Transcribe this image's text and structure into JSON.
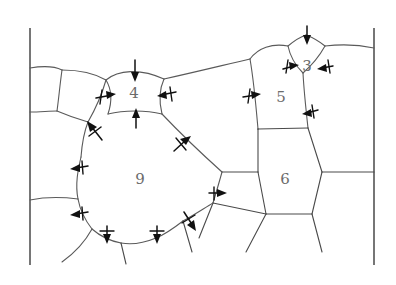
{
  "figure": {
    "width": 396,
    "height": 285,
    "background_color": "#ffffff",
    "boundary_color": "#5a5a5a",
    "label_color": "#6b6b6b",
    "arrow_color": "#111111",
    "frame_color": "#3c3c3c"
  },
  "grains": [
    {
      "id": "grain-4",
      "label": "4",
      "sides": 4,
      "label_x": 134,
      "label_y": 94,
      "curvature": "concave",
      "migration": "inward",
      "note": "Four-sided grain, boundaries bow inward, grain shrinks"
    },
    {
      "id": "grain-3",
      "label": "3",
      "sides": 3,
      "label_x": 307,
      "label_y": 67,
      "curvature": "concave",
      "migration": "inward",
      "note": "Three-sided grain, strongly concave, shrinks rapidly"
    },
    {
      "id": "grain-5",
      "label": "5",
      "sides": 5,
      "label_x": 281,
      "label_y": 98,
      "curvature": "slightly-concave",
      "migration": "inward",
      "note": "Five-sided grain, boundaries slightly concave, slowly shrinks"
    },
    {
      "id": "grain-6",
      "label": "6",
      "sides": 6,
      "label_x": 285,
      "label_y": 180,
      "curvature": "straight",
      "migration": "none",
      "note": "Six-sided grain, straight boundaries, metastable, no net migration"
    },
    {
      "id": "grain-9",
      "label": "9",
      "sides": 9,
      "label_x": 140,
      "label_y": 180,
      "curvature": "convex",
      "migration": "outward",
      "note": "Nine-sided grain, boundaries bow outward, grain grows"
    }
  ],
  "arrows": [
    {
      "id": "arrow-grain4-top",
      "grain": "4",
      "direction": "down",
      "meaning": "boundary migrates into grain 4"
    },
    {
      "id": "arrow-grain4-bottom",
      "grain": "4",
      "direction": "up",
      "meaning": "boundary migrates into grain 4"
    },
    {
      "id": "arrow-grain4-left",
      "grain": "4",
      "direction": "right",
      "meaning": "boundary migrates into grain 4"
    },
    {
      "id": "arrow-grain4-right",
      "grain": "4",
      "direction": "left",
      "meaning": "boundary migrates into grain 4"
    },
    {
      "id": "arrow-grain3-top",
      "grain": "3",
      "direction": "down",
      "meaning": "boundary migrates into grain 3"
    },
    {
      "id": "arrow-grain3-left",
      "grain": "3",
      "direction": "right",
      "meaning": "boundary migrates into grain 3"
    },
    {
      "id": "arrow-grain3-right",
      "grain": "3",
      "direction": "left",
      "meaning": "boundary migrates into grain 3"
    },
    {
      "id": "arrow-grain5-left",
      "grain": "5",
      "direction": "right",
      "meaning": "boundary migrates into grain 5"
    },
    {
      "id": "arrow-grain5-right",
      "grain": "5",
      "direction": "left",
      "meaning": "boundary migrates into grain 5"
    },
    {
      "id": "arrow-grain9-upper-left",
      "grain": "9",
      "direction": "up-left",
      "meaning": "boundary migrates away from grain 9"
    },
    {
      "id": "arrow-grain9-left-upper",
      "grain": "9",
      "direction": "left",
      "meaning": "boundary migrates away from grain 9"
    },
    {
      "id": "arrow-grain9-left-lower",
      "grain": "9",
      "direction": "left",
      "meaning": "boundary migrates away from grain 9"
    },
    {
      "id": "arrow-grain9-bottom-left",
      "grain": "9",
      "direction": "down",
      "meaning": "boundary migrates away from grain 9"
    },
    {
      "id": "arrow-grain9-bottom-mid",
      "grain": "9",
      "direction": "down",
      "meaning": "boundary migrates away from grain 9"
    },
    {
      "id": "arrow-grain9-bottom-right",
      "grain": "9",
      "direction": "down-right",
      "meaning": "boundary migrates away from grain 9"
    },
    {
      "id": "arrow-grain9-upper-right",
      "grain": "9",
      "direction": "up-right",
      "meaning": "boundary migrates away from grain 9"
    },
    {
      "id": "arrow-grain9-right",
      "grain": "9",
      "direction": "right",
      "meaning": "boundary migrates away from grain 9"
    }
  ],
  "frame": {
    "left_line": {
      "x": 30,
      "y_top": 28,
      "y_bottom": 265
    },
    "right_line": {
      "x": 374,
      "y_top": 28,
      "y_bottom": 265
    }
  }
}
